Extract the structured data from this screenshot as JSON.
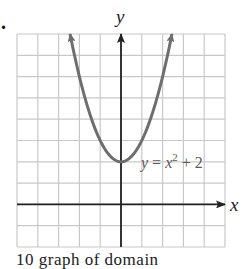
{
  "problem": {
    "number_suffix": ".",
    "bottom_text_fragment": "10     graph of domain"
  },
  "colors": {
    "grid": "#c8c8c8",
    "axis": "#222222",
    "curve": "#6e6e6e",
    "label": "#555555",
    "background": "#ffffff"
  },
  "chart_data": {
    "type": "line",
    "title": "",
    "xlabel": "x",
    "ylabel": "y",
    "xlim": [
      -5,
      5
    ],
    "ylim": [
      -2,
      8
    ],
    "grid": true,
    "grid_step": 1,
    "tick_labels": false,
    "annotations": [
      {
        "text": "y = x² + 2",
        "x": 2.9,
        "y": 2
      }
    ],
    "series": [
      {
        "name": "y = x^2 + 2",
        "function": "x^2 + 2",
        "arrows_at_ends": true,
        "x": [
          -2.45,
          -2.0,
          -1.5,
          -1.0,
          -0.5,
          0.0,
          0.5,
          1.0,
          1.5,
          2.0,
          2.45
        ],
        "y": [
          8.0,
          6.0,
          4.25,
          3.0,
          2.25,
          2.0,
          2.25,
          3.0,
          4.25,
          6.0,
          8.0
        ]
      }
    ]
  },
  "labels": {
    "x_axis": "x",
    "y_axis": "y",
    "equation_y": "y",
    "equation_eq": " = ",
    "equation_x": "x",
    "equation_exp": "2",
    "equation_rest": " + 2"
  }
}
